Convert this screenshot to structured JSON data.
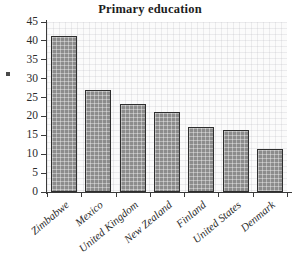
{
  "chart_data": {
    "type": "bar",
    "title": "Primary education",
    "xlabel": "",
    "ylabel": "",
    "categories": [
      "Zimbabwe",
      "Mexico",
      "United Kingdom",
      "New Zealand",
      "Finland",
      "United States",
      "Denmark"
    ],
    "values": [
      41.2,
      27.1,
      23.3,
      21.2,
      17.2,
      16.3,
      11.4
    ],
    "ylim": [
      0,
      45
    ],
    "yticks": [
      0,
      5,
      10,
      15,
      20,
      25,
      30,
      35,
      40,
      45
    ],
    "ytick_labels": [
      "0",
      "5",
      "10",
      "15",
      "20",
      "25",
      "30",
      "35",
      "40",
      "45"
    ],
    "grid": true,
    "legend": "none",
    "bar_fill_color": "#8c8c8c",
    "bar_edge_color": "#2e2e2e",
    "plot_background_color": "#fbfbfb",
    "axis_color": "#3a3a3a",
    "text_color": "#2b2b2b"
  },
  "axis": {
    "y_stub_glyph": ""
  }
}
